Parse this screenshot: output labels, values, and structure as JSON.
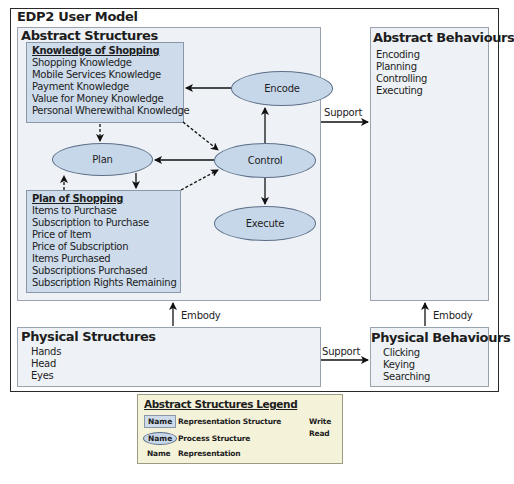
{
  "title": "EDP2 User Model",
  "abstract_structures": {
    "title": "Abstract Structures",
    "knowledge": {
      "heading": "Knowledge of Shopping",
      "items": [
        "Shopping Knowledge",
        "Mobile Services Knowledge",
        "Payment Knowledge",
        "Value for Money Knowledge",
        "Personal Wherewithal Knowledge"
      ]
    },
    "plan_of_shopping": {
      "heading": "Plan of Shopping",
      "items": [
        "Items to Purchase",
        "Subscription to Purchase",
        "Price of Item",
        "Price of Subscription",
        "Items Purchased",
        "Subscriptions Purchased",
        "Subscription Rights Remaining"
      ]
    },
    "processes": {
      "encode": "Encode",
      "plan": "Plan",
      "control": "Control",
      "execute": "Execute"
    }
  },
  "abstract_behaviours": {
    "title": "Abstract Behaviours",
    "items": [
      "Encoding",
      "Planning",
      "Controlling",
      "Executing"
    ]
  },
  "physical_structures": {
    "title": "Physical Structures",
    "items": [
      "Hands",
      "Head",
      "Eyes"
    ]
  },
  "physical_behaviours": {
    "title": "Physical Behaviours",
    "items": [
      "Clicking",
      "Keying",
      "Searching"
    ]
  },
  "connectors": {
    "support_top": "Support",
    "support_bottom": "Support",
    "embody_left": "Embody",
    "embody_right": "Embody"
  },
  "legend": {
    "title": "Abstract Structures Legend",
    "rows": [
      {
        "sample": "Name",
        "text": "Representation Structure"
      },
      {
        "sample": "Name",
        "text": "Process Structure"
      },
      {
        "sample": "Name",
        "text": "Representation"
      }
    ],
    "write": "Write",
    "read": "Read"
  },
  "colors": {
    "representation_fill": "#cddbeb",
    "process_fill": "#c7d7ea",
    "panel_fill": "#eef2f6",
    "legend_fill": "#f4f2d9"
  }
}
